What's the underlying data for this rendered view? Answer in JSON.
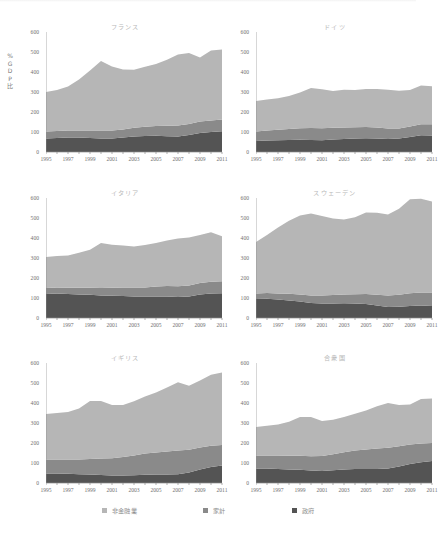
{
  "figure": {
    "axis_title_lines": [
      "%",
      "G",
      "D",
      "P",
      "比"
    ],
    "y_ticks": [
      0,
      100,
      200,
      300,
      400,
      500,
      600
    ],
    "x_ticks": [
      1995,
      1997,
      1999,
      2001,
      2003,
      2005,
      2007,
      2009,
      2011
    ]
  },
  "legend": {
    "items": [
      {
        "label": "非金融業",
        "color": "#b6b6b6"
      },
      {
        "label": "家計",
        "color": "#8a8a8a"
      },
      {
        "label": "政府",
        "color": "#545454"
      }
    ]
  },
  "chart_data": {
    "type": "area",
    "title": "",
    "xlabel": "",
    "ylabel": "%GDP比",
    "xlim": [
      1995,
      2011
    ],
    "ylim": [
      0,
      600
    ],
    "grid": false,
    "legend_position": "bottom",
    "stacked": true,
    "x": [
      1995,
      1996,
      1997,
      1998,
      1999,
      2000,
      2001,
      2002,
      2003,
      2004,
      2005,
      2006,
      2007,
      2008,
      2009,
      2010,
      2011
    ],
    "panels": [
      {
        "title": "フランス",
        "series": [
          {
            "name": "政府",
            "values": [
              68,
              70,
              72,
              72,
              70,
              68,
              68,
              72,
              78,
              80,
              81,
              79,
              78,
              85,
              95,
              100,
              104
            ]
          },
          {
            "name": "家計",
            "values": [
              35,
              35,
              35,
              36,
              38,
              40,
              40,
              41,
              43,
              46,
              49,
              52,
              54,
              55,
              57,
              58,
              58
            ]
          },
          {
            "name": "非金融業",
            "values": [
              197,
              205,
              220,
              255,
              300,
              347,
              320,
              300,
              290,
              300,
              310,
              330,
              355,
              355,
              320,
              350,
              350
            ]
          }
        ]
      },
      {
        "title": "ドイツ",
        "series": [
          {
            "name": "政府",
            "values": [
              55,
              58,
              59,
              60,
              61,
              60,
              59,
              62,
              65,
              67,
              69,
              68,
              65,
              67,
              75,
              84,
              82
            ]
          },
          {
            "name": "家計",
            "values": [
              48,
              50,
              52,
              55,
              58,
              60,
              60,
              59,
              58,
              57,
              56,
              54,
              52,
              51,
              53,
              55,
              57
            ]
          },
          {
            "name": "非金融業",
            "values": [
              152,
              155,
              158,
              165,
              178,
              200,
              195,
              184,
              188,
              186,
              190,
              193,
              194,
              188,
              182,
              193,
              190
            ]
          }
        ]
      },
      {
        "title": "イタリア",
        "series": [
          {
            "name": "政府",
            "values": [
              120,
              122,
              120,
              118,
              116,
              112,
              111,
              110,
              108,
              107,
              108,
              108,
              105,
              108,
              118,
              122,
              124
            ]
          },
          {
            "name": "家計",
            "values": [
              30,
              30,
              31,
              33,
              35,
              38,
              40,
              42,
              44,
              46,
              49,
              52,
              54,
              55,
              57,
              59,
              60
            ]
          },
          {
            "name": "非金融業",
            "values": [
              155,
              158,
              162,
              175,
              190,
              225,
              215,
              210,
              206,
              212,
              218,
              228,
              238,
              240,
              240,
              248,
              225
            ]
          }
        ]
      },
      {
        "title": "スウェーデン",
        "series": [
          {
            "name": "政府",
            "values": [
              95,
              96,
              92,
              88,
              82,
              75,
              72,
              73,
              74,
              72,
              70,
              62,
              55,
              56,
              60,
              62,
              60
            ]
          },
          {
            "name": "家計",
            "values": [
              28,
              29,
              31,
              33,
              36,
              38,
              40,
              42,
              44,
              47,
              50,
              54,
              58,
              60,
              64,
              66,
              67
            ]
          },
          {
            "name": "非金融業",
            "values": [
              257,
              290,
              330,
              365,
              395,
              410,
              398,
              383,
              375,
              385,
              408,
              410,
              405,
              430,
              470,
              468,
              455
            ]
          }
        ]
      },
      {
        "title": "イギリス",
        "series": [
          {
            "name": "政府",
            "values": [
              48,
              48,
              46,
              44,
              42,
              40,
              38,
              38,
              39,
              41,
              42,
              43,
              44,
              52,
              68,
              80,
              88
            ]
          },
          {
            "name": "家計",
            "values": [
              70,
              70,
              71,
              74,
              78,
              82,
              86,
              92,
              98,
              106,
              110,
              114,
              118,
              114,
              110,
              106,
              102
            ]
          },
          {
            "name": "非金融業",
            "values": [
              227,
              232,
              238,
              255,
              290,
              288,
              266,
              260,
              272,
              285,
              300,
              320,
              342,
              320,
              335,
              355,
              362
            ]
          }
        ]
      },
      {
        "title": "合衆国",
        "series": [
          {
            "name": "政府",
            "values": [
              72,
              72,
              70,
              68,
              66,
              62,
              60,
              64,
              68,
              70,
              70,
              70,
              72,
              82,
              95,
              104,
              110
            ]
          },
          {
            "name": "家計",
            "values": [
              65,
              66,
              67,
              68,
              70,
              72,
              75,
              80,
              86,
              92,
              98,
              102,
              104,
              102,
              98,
              94,
              90
            ]
          },
          {
            "name": "非金融業",
            "values": [
              143,
              148,
              155,
              170,
              194,
              196,
              175,
              172,
              176,
              184,
              194,
              212,
              224,
              206,
              200,
              222,
              222
            ]
          }
        ]
      }
    ]
  }
}
